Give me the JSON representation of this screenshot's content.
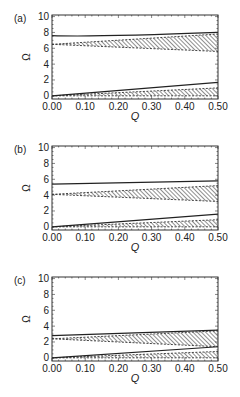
{
  "figure": {
    "x_label": "Q",
    "y_label": "Ω",
    "x_ticks": [
      "0.00",
      "0.10",
      "0.20",
      "0.30",
      "0.40",
      "0.50"
    ],
    "y_ticks": [
      "0",
      "2",
      "4",
      "6",
      "8",
      "10"
    ]
  },
  "chart_data": [
    {
      "type": "line",
      "panel": "(a)",
      "xlabel": "Q",
      "ylabel": "Ω",
      "xlim": [
        0,
        0.5
      ],
      "ylim": [
        -0.4,
        10.2
      ],
      "x": [
        0.0,
        0.5
      ],
      "series": [
        {
          "name": "upper solid",
          "style": "solid",
          "values": [
            7.6,
            8.0
          ],
          "mid": {
            "x": 0.12,
            "y": 7.4
          }
        },
        {
          "name": "upper hatched band top",
          "style": "dashed-hatch",
          "values": [
            6.5,
            7.8
          ]
        },
        {
          "name": "upper hatched band bottom",
          "style": "dashed-hatch",
          "values": [
            6.5,
            5.6
          ]
        },
        {
          "name": "lower solid",
          "style": "solid",
          "values": [
            0.0,
            1.7
          ]
        },
        {
          "name": "lower hatched band top",
          "style": "dashed-hatch",
          "values": [
            0.0,
            1.0
          ]
        },
        {
          "name": "lower hatched band bottom",
          "style": "dashed-hatch",
          "values": [
            0.0,
            0.0
          ]
        }
      ]
    },
    {
      "type": "line",
      "panel": "(b)",
      "xlabel": "Q",
      "ylabel": "Ω",
      "xlim": [
        0,
        0.5
      ],
      "ylim": [
        -0.4,
        10.2
      ],
      "x": [
        0.0,
        0.5
      ],
      "series": [
        {
          "name": "upper solid",
          "style": "solid",
          "values": [
            5.4,
            5.8
          ]
        },
        {
          "name": "upper hatched band top",
          "style": "dashed-hatch",
          "values": [
            4.1,
            5.2
          ]
        },
        {
          "name": "upper hatched band bottom",
          "style": "dashed-hatch",
          "values": [
            4.1,
            3.2
          ]
        },
        {
          "name": "lower solid",
          "style": "solid",
          "values": [
            0.0,
            1.6
          ]
        },
        {
          "name": "lower hatched band top",
          "style": "dashed-hatch",
          "values": [
            0.0,
            0.9
          ]
        },
        {
          "name": "lower hatched band bottom",
          "style": "dashed-hatch",
          "values": [
            0.0,
            0.0
          ]
        }
      ]
    },
    {
      "type": "line",
      "panel": "(c)",
      "xlabel": "Q",
      "ylabel": "Ω",
      "xlim": [
        0,
        0.5
      ],
      "ylim": [
        -0.4,
        10.2
      ],
      "x": [
        0.0,
        0.5
      ],
      "series": [
        {
          "name": "upper solid",
          "style": "solid",
          "values": [
            2.8,
            3.5
          ]
        },
        {
          "name": "upper hatched band top",
          "style": "dashed-hatch",
          "values": [
            2.4,
            3.4
          ]
        },
        {
          "name": "upper hatched band bottom",
          "style": "dashed-hatch",
          "values": [
            2.4,
            1.4
          ]
        },
        {
          "name": "lower solid",
          "style": "solid",
          "values": [
            0.0,
            1.4
          ]
        },
        {
          "name": "lower hatched band top",
          "style": "dashed-hatch",
          "values": [
            0.0,
            0.8
          ]
        },
        {
          "name": "lower hatched band bottom",
          "style": "dashed-hatch",
          "values": [
            0.0,
            0.0
          ]
        }
      ]
    }
  ]
}
